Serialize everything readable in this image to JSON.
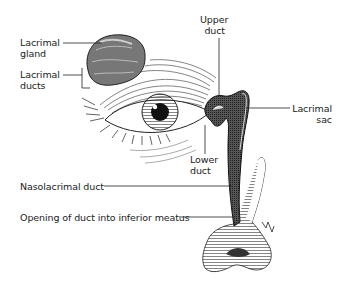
{
  "diagram": {
    "labels": {
      "lacrimal_gland": {
        "line1": "Lacrimal",
        "line2": "gland"
      },
      "lacrimal_ducts": {
        "line1": "Lacrimal",
        "line2": "ducts"
      },
      "upper_duct": {
        "line1": "Upper",
        "line2": "duct"
      },
      "lacrimal_sac": {
        "line1": "Lacrimal",
        "line2": "sac"
      },
      "lower_duct": {
        "line1": "Lower",
        "line2": "duct"
      },
      "nasolacrimal_duct": "Nasolacrimal duct",
      "opening": "Opening of duct into inferior meatus"
    },
    "colors": {
      "ink": "#1a1a1a",
      "background": "#ffffff",
      "gland_fill": "#8a8a8a"
    }
  }
}
